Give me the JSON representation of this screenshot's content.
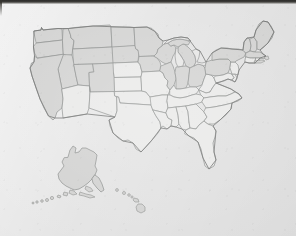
{
  "document": {
    "type": "scanned-map-image",
    "title": "Blank outline map of the United States",
    "medium": "photocopied / scanned paper",
    "background_color": "#e4e4e4",
    "has_visible_text": false,
    "caption": ""
  },
  "artifacts": {
    "top_scan_band": {
      "name": "dark scan edge band",
      "color": "#2c2b29",
      "position": "top",
      "height_px": 4
    },
    "paper_texture": "light gray speckled photocopy grain"
  },
  "map": {
    "name": "united-states-outline-map",
    "projection_look": "albers-like conterminous US with Alaska and Hawaii insets",
    "line_color": "#8b8d8c",
    "coast_color": "#6f706f",
    "fills": {
      "shaded": "#d2d2d1",
      "plain": "#e9e9e8",
      "lake": "#e6e6e5"
    },
    "regions": [
      {
        "id": "conterminous",
        "label": "Conterminous United States",
        "shading": "mixed"
      },
      {
        "id": "alaska",
        "label": "Alaska inset",
        "shading": "shaded"
      },
      {
        "id": "hawaii",
        "label": "Hawaii inset",
        "shading": "shaded"
      }
    ],
    "shaded_states": [
      "Washington",
      "Oregon",
      "Idaho",
      "Montana",
      "Wyoming",
      "North Dakota",
      "South Dakota",
      "Minnesota",
      "Wisconsin",
      "Michigan",
      "Maine",
      "New Hampshire",
      "Vermont",
      "New York",
      "Massachusetts",
      "California",
      "Nevada",
      "Utah",
      "Colorado",
      "Nebraska",
      "Iowa",
      "Illinois",
      "Indiana",
      "Ohio",
      "Pennsylvania",
      "Alaska",
      "Hawaii"
    ],
    "unshaded_states": [
      "Arizona",
      "New Mexico",
      "Texas",
      "Oklahoma",
      "Kansas",
      "Missouri",
      "Arkansas",
      "Louisiana",
      "Mississippi",
      "Alabama",
      "Tennessee",
      "Kentucky",
      "West Virginia",
      "Virginia",
      "North Carolina",
      "South Carolina",
      "Georgia",
      "Florida",
      "Maryland",
      "Delaware",
      "New Jersey",
      "Connecticut",
      "Rhode Island"
    ],
    "features": [
      {
        "name": "Great Lakes",
        "kind": "lakes"
      },
      {
        "name": "Florida peninsula",
        "kind": "peninsula"
      },
      {
        "name": "Aleutian Islands",
        "kind": "island-chain"
      },
      {
        "name": "Hawaiian Islands",
        "kind": "island-chain"
      },
      {
        "name": "Alaska panhandle",
        "kind": "coast"
      },
      {
        "name": "Chesapeake Bay",
        "kind": "bay"
      },
      {
        "name": "Cape Cod",
        "kind": "cape"
      },
      {
        "name": "Long Island",
        "kind": "island"
      }
    ]
  }
}
